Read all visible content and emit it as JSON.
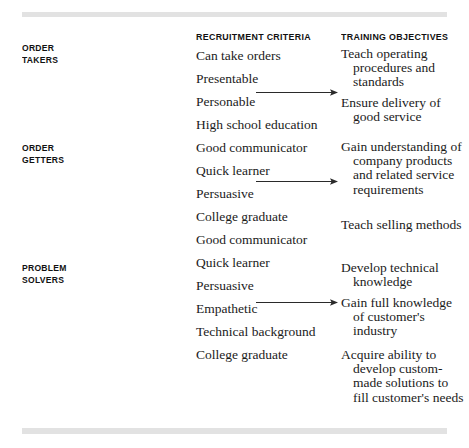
{
  "figure": {
    "headers": {
      "criteria": "RECRUITMENT CRITERIA",
      "objectives": "TRAINING OBJECTIVES"
    },
    "groups": [
      {
        "label_line1": "ORDER",
        "label_line2": "TAKERS",
        "criteria": [
          "Can take orders",
          "Presentable",
          "Personable",
          "High school education"
        ],
        "objectives": [
          "Teach operating procedures and standards",
          "Ensure delivery of good service"
        ]
      },
      {
        "label_line1": "ORDER",
        "label_line2": "GETTERS",
        "criteria": [
          "Good communicator",
          "Quick learner",
          "Persuasive",
          "College graduate"
        ],
        "objectives": [
          "Gain understanding of company products and related service requirements",
          "Teach selling methods"
        ]
      },
      {
        "label_line1": "PROBLEM",
        "label_line2": "SOLVERS",
        "criteria": [
          "Good communicator",
          "Quick learner",
          "Persuasive",
          "Empathetic",
          "Technical background",
          "College graduate"
        ],
        "objectives": [
          "Develop technical knowledge",
          "Gain full knowledge of customer's industry",
          "Acquire ability to develop custom-made solutions to fill customer's needs"
        ]
      }
    ],
    "connectors": [
      "arrow-right-icon",
      "arrow-right-icon",
      "arrow-right-icon"
    ],
    "colors": {
      "text": "#1b1b1b",
      "heading": "#111111",
      "rule": "#e2e2e2",
      "arrow": "#2a2a2a"
    }
  }
}
